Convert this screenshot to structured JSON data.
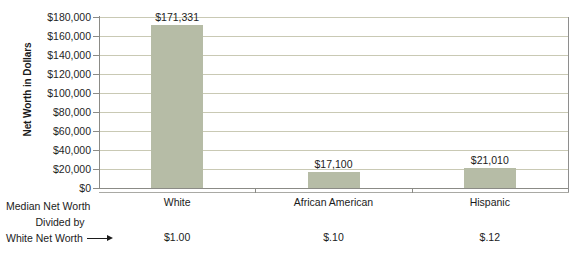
{
  "chart_data": {
    "type": "bar",
    "title": "",
    "xlabel": "",
    "ylabel": "Net Worth in Dollars",
    "categories": [
      "White",
      "African American",
      "Hispanic"
    ],
    "values": [
      171331,
      17100,
      21010
    ],
    "value_labels": [
      "$171,331",
      "$17,100",
      "$21,010"
    ],
    "ratio_labels": [
      "$1.00",
      "$.10",
      "$.12"
    ],
    "ylim": [
      0,
      180000
    ],
    "ytick_values": [
      0,
      20000,
      40000,
      60000,
      80000,
      100000,
      120000,
      140000,
      160000,
      180000
    ],
    "ytick_labels": [
      "$0",
      "$20,000",
      "$40,000",
      "$60,000",
      "$80,000",
      "$100,000",
      "$120,000",
      "$140,000",
      "$160,000",
      "$180,000"
    ],
    "grid": true,
    "legend": "none",
    "series": [
      {
        "name": "Median Net Worth",
        "values": [
          171331,
          17100,
          21010
        ]
      }
    ],
    "annotations": {
      "footer_line1": "Median Net Worth",
      "footer_line2": "Divided by",
      "footer_line3": "White Net Worth"
    },
    "colors": {
      "bar_fill": "#b6bca6",
      "gridline": "#c9c9b4",
      "axis_line": "#8b8b86",
      "text": "#1b1b1b",
      "background": "#ffffff"
    }
  }
}
